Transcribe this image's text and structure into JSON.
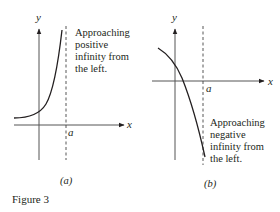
{
  "figure": {
    "caption": "Figure 3",
    "panels": [
      {
        "id": "a",
        "sublabel": "(a)",
        "axis_x_label": "x",
        "axis_y_label": "y",
        "asymptote_label": "a",
        "annotation_lines": [
          "Approaching",
          "positive",
          "infinity from",
          "the left."
        ],
        "behavior": "approaches positive infinity as x approaches a from the left"
      },
      {
        "id": "b",
        "sublabel": "(b)",
        "axis_x_label": "x",
        "axis_y_label": "y",
        "asymptote_label": "a",
        "annotation_lines": [
          "Approaching",
          "negative",
          "infinity from",
          "the left."
        ],
        "behavior": "approaches negative infinity as x approaches a from the left"
      }
    ]
  },
  "colors": {
    "ink": "#231f20",
    "axis": "#555555",
    "background": "#ffffff"
  }
}
